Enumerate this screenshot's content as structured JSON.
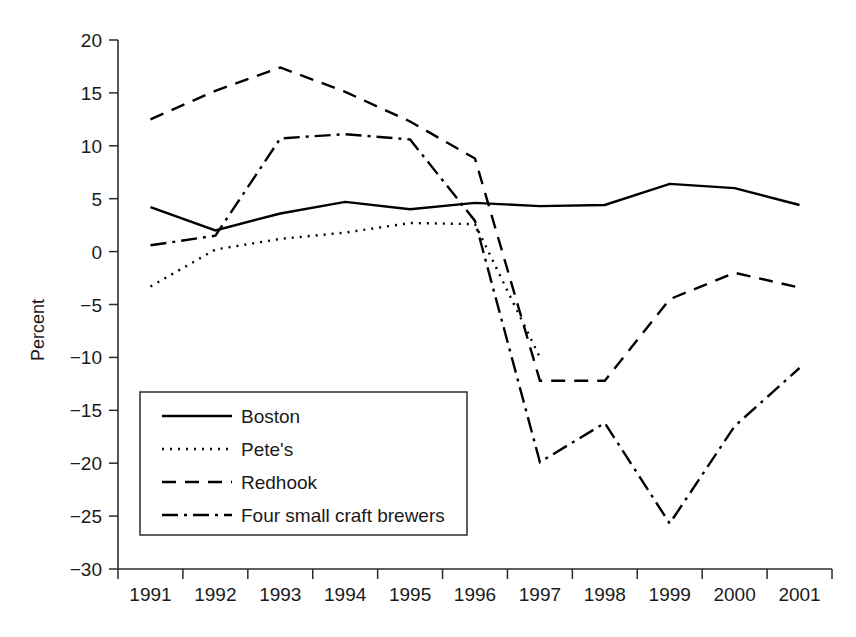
{
  "chart_data": {
    "type": "line",
    "title": "",
    "xlabel": "",
    "ylabel": "Percent",
    "xlim": [
      1991,
      2001
    ],
    "ylim": [
      -30,
      20
    ],
    "ytick_step": 5,
    "grid": false,
    "legend_position": "lower-left-inside",
    "x": [
      1991,
      1992,
      1993,
      1994,
      1995,
      1996,
      1997,
      1998,
      1999,
      2000,
      2001
    ],
    "categories": [
      "1991",
      "1992",
      "1993",
      "1994",
      "1995",
      "1996",
      "1997",
      "1998",
      "1999",
      "2000",
      "2001"
    ],
    "yticks": [
      20,
      15,
      10,
      5,
      0,
      -5,
      -10,
      -15,
      -20,
      -25,
      -30
    ],
    "ytick_labels": [
      "20",
      "15",
      "10",
      "5",
      "0",
      "−5",
      "−10",
      "−15",
      "−20",
      "−25",
      "−30"
    ],
    "series": [
      {
        "name": "Boston",
        "style": "solid",
        "dasharray": "",
        "values": [
          4.2,
          2.0,
          3.6,
          4.7,
          4.0,
          4.6,
          4.3,
          4.4,
          6.4,
          6.0,
          4.4
        ]
      },
      {
        "name": "Pete's",
        "style": "dotted",
        "dasharray": "2,6",
        "values": [
          -3.3,
          0.2,
          1.2,
          1.8,
          2.7,
          2.6,
          -10.0,
          null,
          null,
          null,
          null
        ]
      },
      {
        "name": "Redhook",
        "style": "dashed",
        "dasharray": "14,9",
        "values": [
          12.5,
          15.2,
          17.4,
          15.1,
          12.3,
          8.8,
          -12.2,
          -12.2,
          -4.5,
          -2.0,
          -3.4
        ]
      },
      {
        "name": "Four small craft brewers",
        "style": "dash-dot",
        "dasharray": "16,6,3,6",
        "values": [
          0.6,
          1.5,
          10.7,
          11.1,
          10.6,
          2.9,
          -19.9,
          -16.2,
          -25.7,
          -16.5,
          -11.0
        ]
      }
    ]
  },
  "legend": {
    "items": [
      {
        "label": "Boston",
        "style": "solid"
      },
      {
        "label": "Pete's",
        "style": "dotted"
      },
      {
        "label": "Redhook",
        "style": "dashed"
      },
      {
        "label": "Four small craft brewers",
        "style": "dash-dot"
      }
    ]
  },
  "axes": {
    "y_title": "Percent"
  }
}
